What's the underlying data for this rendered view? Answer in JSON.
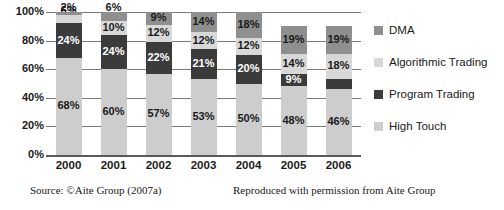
{
  "chart_data": {
    "type": "bar",
    "stacked": true,
    "stack_total": 100,
    "title": "",
    "xlabel": "",
    "ylabel": "",
    "ylim": [
      0,
      100
    ],
    "ytick_labels": [
      "0%",
      "20%",
      "40%",
      "60%",
      "80%",
      "100%"
    ],
    "ytick_values": [
      0,
      20,
      40,
      60,
      80,
      100
    ],
    "grid": true,
    "legend_position": "right",
    "categories": [
      "2000",
      "2001",
      "2002",
      "2003",
      "2004",
      "2005",
      "2006"
    ],
    "series": [
      {
        "name": "High Touch",
        "color": "#cdcdcd",
        "label_color": "#1a1a1a",
        "values": [
          68,
          60,
          57,
          53,
          50,
          48,
          46
        ],
        "labels": [
          "68%",
          "60%",
          "57%",
          "53%",
          "50%",
          "48%",
          "46%"
        ]
      },
      {
        "name": "Program Trading",
        "color": "#3b3b3b",
        "label_color": "#ffffff",
        "values": [
          24,
          24,
          22,
          21,
          20,
          9,
          7
        ],
        "labels": [
          "24%",
          "24%",
          "22%",
          "21%",
          "20%",
          "9%",
          "7%"
        ]
      },
      {
        "name": "Algorithmic Trading",
        "color": "#d8d8d8",
        "label_color": "#1a1a1a",
        "values": [
          6,
          10,
          12,
          12,
          12,
          14,
          18
        ],
        "labels": [
          "6%",
          "10%",
          "12%",
          "12%",
          "12%",
          "14%",
          "18%"
        ]
      },
      {
        "name": "DMA",
        "color": "#8f8f8f",
        "label_color": "#1a1a1a",
        "values": [
          2,
          6,
          9,
          14,
          18,
          19,
          19
        ],
        "labels": [
          "2%",
          "6%",
          "9%",
          "14%",
          "18%",
          "19%",
          "19%"
        ]
      }
    ]
  },
  "legend": {
    "items": [
      {
        "label": "DMA",
        "color": "#8f8f8f"
      },
      {
        "label": "Algorithmic Trading",
        "color": "#d8d8d8"
      },
      {
        "label": "Program Trading",
        "color": "#3b3b3b"
      },
      {
        "label": "High Touch",
        "color": "#cdcdcd"
      }
    ]
  },
  "footer": {
    "source": "Source: ©Aite Group (2007a)",
    "permission": "Reproduced with permission from Aite Group"
  }
}
